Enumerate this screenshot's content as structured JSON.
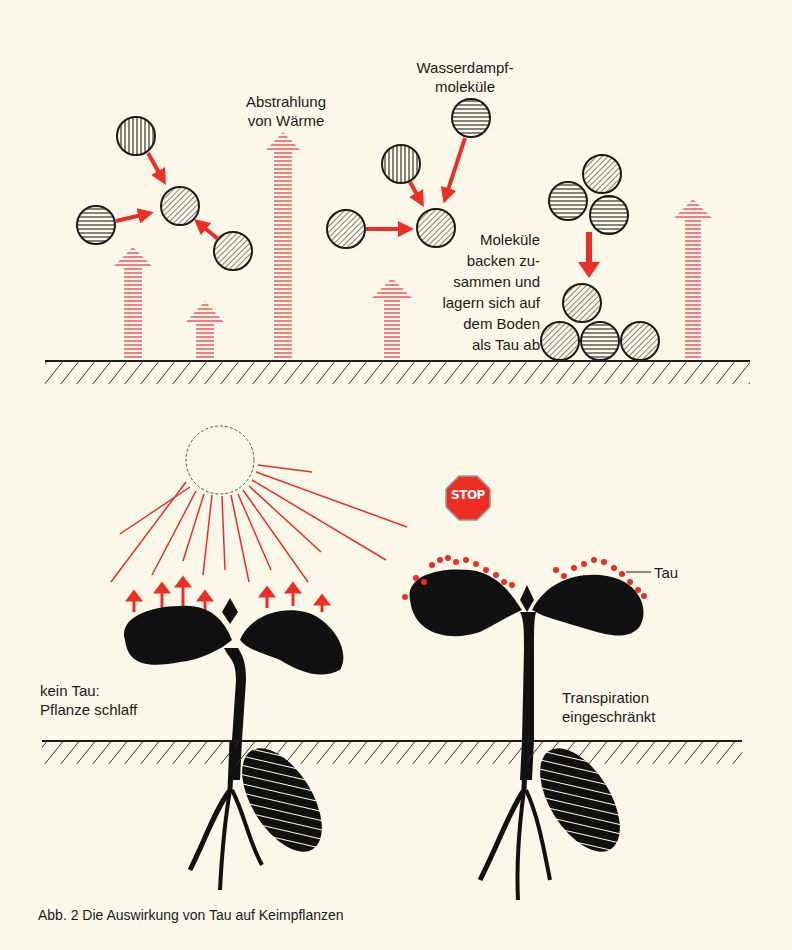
{
  "colors": {
    "background": "#fbf8ea",
    "red": "#ee2d24",
    "pink_arrow": "#f08080",
    "ink": "#1a1a1a"
  },
  "top_panel": {
    "label_radiation": [
      "Abstrahlung",
      "von Wärme"
    ],
    "label_vapor": [
      "Wasserdampf-",
      "moleküle"
    ],
    "label_molecules": [
      "Moleküle",
      "backen zu-",
      "sammen und",
      "lagern sich auf",
      "dem Boden",
      "als Tau ab"
    ]
  },
  "bottom_panel": {
    "stop_sign": "STOP",
    "label_dew": "Tau",
    "label_left": [
      "kein Tau:",
      "Pflanze schlaff"
    ],
    "label_right": [
      "Transpiration",
      "eingeschränkt"
    ]
  },
  "caption": "Abb. 2 Die Auswirkung von Tau auf Keimpflanzen"
}
